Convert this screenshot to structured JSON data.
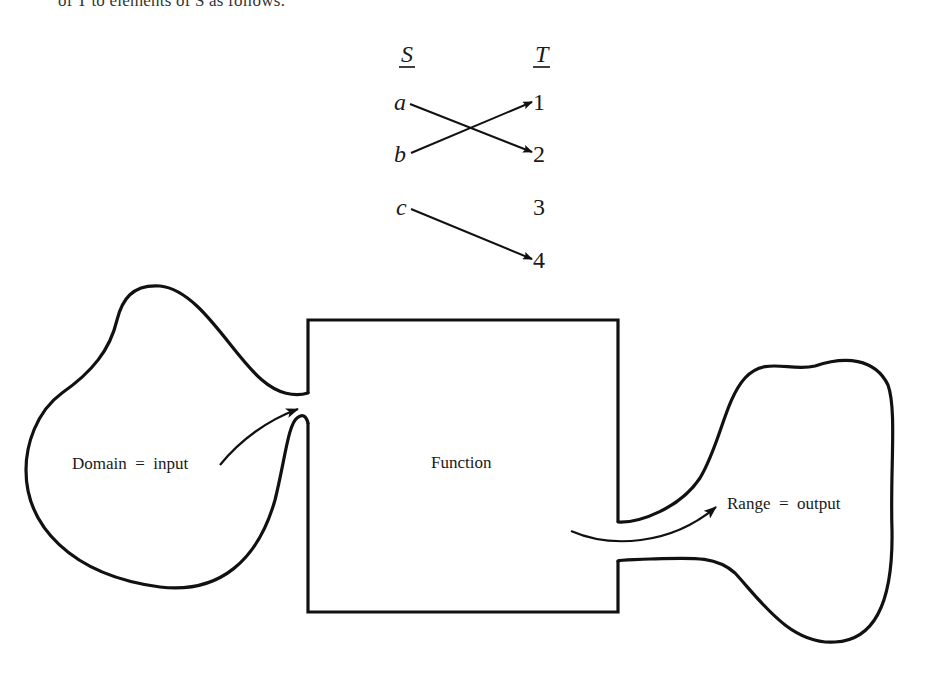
{
  "header_fragment": "of T to elements of S as follows:",
  "mapping": {
    "source_set": "S",
    "target_set": "T",
    "source_elements": [
      "a",
      "b",
      "c"
    ],
    "target_elements": [
      "1",
      "2",
      "3",
      "4"
    ],
    "arrows": [
      {
        "from": "a",
        "to": "2"
      },
      {
        "from": "b",
        "to": "1"
      },
      {
        "from": "c",
        "to": "4"
      }
    ]
  },
  "function_diagram": {
    "box_label": "Function",
    "domain_label": "Domain  =  input",
    "range_label": "Range  =  output"
  },
  "colors": {
    "ink": "#111111",
    "background": "#ffffff"
  }
}
